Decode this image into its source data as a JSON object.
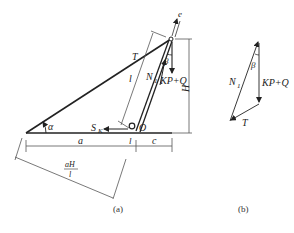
{
  "figure_a": {
    "caption": "(a)",
    "labels": {
      "e": "e",
      "T": "T",
      "beta": "β",
      "l_side": "l",
      "N1": "N",
      "N1_sub": "1",
      "KPQ": "KP+Q",
      "H": "H",
      "alpha": "α",
      "SK": "S",
      "SK_sub": "K",
      "O": "O",
      "a": "a",
      "l_small": "l",
      "c": "c",
      "frac_num": "aH",
      "frac_den": "l"
    }
  },
  "figure_b": {
    "caption": "(b)",
    "labels": {
      "N1": "N",
      "N1_sub": "1",
      "beta": "β",
      "KPQ": "KP+Q",
      "T": "T"
    }
  },
  "colors": {
    "line": "#222222",
    "thin": "#555555",
    "text": "#222222"
  }
}
